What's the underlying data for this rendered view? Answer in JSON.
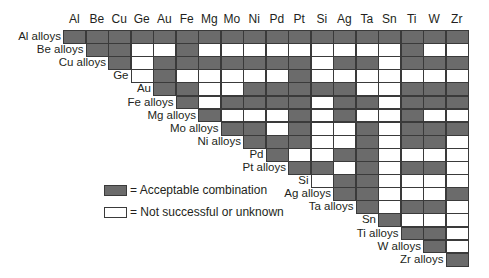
{
  "columns": [
    "Al",
    "Be",
    "Cu",
    "Ge",
    "Au",
    "Fe",
    "Mg",
    "Mo",
    "Ni",
    "Pd",
    "Pt",
    "Si",
    "Ag",
    "Ta",
    "Sn",
    "Ti",
    "W",
    "Zr"
  ],
  "rows": [
    "Al alloys",
    "Be alloys",
    "Cu alloys",
    "Ge",
    "Au",
    "Fe alloys",
    "Mg alloys",
    "Mo alloys",
    "Ni alloys",
    "Pd",
    "Pt alloys",
    "Si",
    "Ag alloys",
    "Ta alloys",
    "Sn",
    "Ti alloys",
    "W alloys",
    "Zr alloys"
  ],
  "matrix": [
    [
      1,
      1,
      1,
      1,
      1,
      1,
      1,
      1,
      1,
      1,
      1,
      1,
      1,
      1,
      1,
      1,
      1,
      1
    ],
    [
      1,
      1,
      0,
      0,
      1,
      0,
      0,
      0,
      0,
      0,
      0,
      0,
      0,
      0,
      1,
      0,
      0
    ],
    [
      1,
      0,
      1,
      1,
      1,
      1,
      1,
      1,
      1,
      0,
      1,
      1,
      0,
      1,
      1,
      1
    ],
    [
      0,
      1,
      0,
      0,
      0,
      0,
      0,
      1,
      0,
      0,
      0,
      0,
      0,
      0,
      0
    ],
    [
      1,
      1,
      0,
      0,
      1,
      1,
      1,
      1,
      1,
      0,
      0,
      1,
      1,
      1
    ],
    [
      1,
      0,
      1,
      1,
      1,
      1,
      0,
      1,
      1,
      0,
      1,
      1,
      1
    ],
    [
      1,
      0,
      0,
      0,
      1,
      0,
      1,
      0,
      0,
      1,
      0,
      0
    ],
    [
      1,
      1,
      0,
      1,
      0,
      0,
      1,
      0,
      1,
      1,
      1
    ],
    [
      1,
      1,
      1,
      0,
      0,
      1,
      0,
      1,
      1,
      0
    ],
    [
      1,
      0,
      0,
      1,
      1,
      0,
      0,
      0,
      0
    ],
    [
      1,
      1,
      0,
      1,
      0,
      1,
      1,
      0
    ],
    [
      0,
      1,
      1,
      0,
      0,
      0,
      0
    ],
    [
      1,
      1,
      0,
      0,
      0,
      1
    ],
    [
      1,
      0,
      1,
      1,
      0
    ],
    [
      1,
      0,
      0,
      0
    ],
    [
      1,
      1,
      0
    ],
    [
      1,
      0
    ],
    [
      1
    ]
  ],
  "legend": {
    "acceptable": "= Acceptable combination",
    "not_successful": "= Not successful or unknown"
  },
  "colors": {
    "acceptable": "#6b6b6b",
    "not_successful": "#ffffff",
    "grid": "#3a3a3a"
  },
  "chart_data": {
    "type": "table",
    "title": "",
    "categories": [
      "Al",
      "Be",
      "Cu",
      "Ge",
      "Au",
      "Fe",
      "Mg",
      "Mo",
      "Ni",
      "Pd",
      "Pt",
      "Si",
      "Ag",
      "Ta",
      "Sn",
      "Ti",
      "W",
      "Zr"
    ],
    "row_labels": [
      "Al alloys",
      "Be alloys",
      "Cu alloys",
      "Ge",
      "Au",
      "Fe alloys",
      "Mg alloys",
      "Mo alloys",
      "Ni alloys",
      "Pd",
      "Pt alloys",
      "Si",
      "Ag alloys",
      "Ta alloys",
      "Sn",
      "Ti alloys",
      "W alloys",
      "Zr alloys"
    ],
    "legend": [
      "Acceptable combination",
      "Not successful or unknown"
    ]
  }
}
